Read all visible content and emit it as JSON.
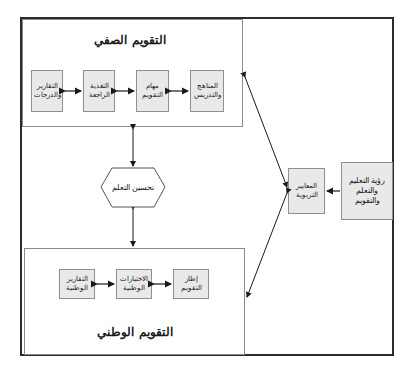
{
  "classroom_assessment": {
    "title": "التقويم الصفي",
    "boxes": [
      {
        "label": "المناهج والتدريس"
      },
      {
        "label": "مهام التقويم"
      },
      {
        "label": "التغذية الراجعة"
      },
      {
        "label": "التقارير والدرجات"
      }
    ]
  },
  "center": {
    "label": "تحسين التعلم"
  },
  "national_assessment": {
    "title": "التقويم الوطني",
    "boxes": [
      {
        "label": "إطار التقويم"
      },
      {
        "label": "الاختبارات الوطنية"
      },
      {
        "label": "التقارير الوطنية"
      }
    ]
  },
  "standards": {
    "label": "المعايير التربوية"
  },
  "vision": {
    "label": "رؤية التعليم والتعلم والتقويم"
  },
  "colors": {
    "box_fill": "#e9e9e9",
    "frame": "#2b2b2b",
    "arrow": "#1a1a1a"
  }
}
